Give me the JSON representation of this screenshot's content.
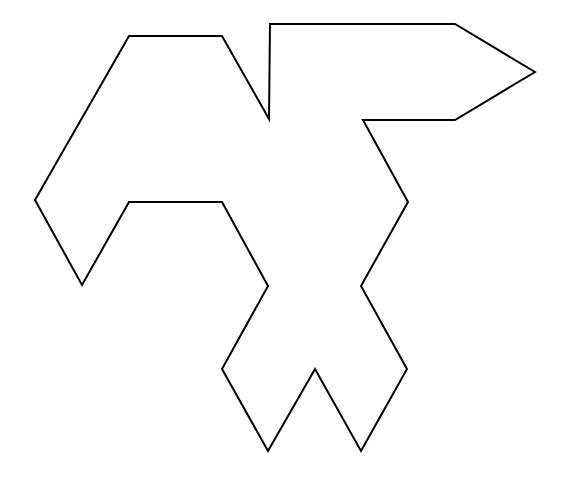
{
  "diagram": {
    "type": "polygon-outline",
    "stroke_color": "#000000",
    "fill_color": "#ffffff",
    "background_color": "#ffffff",
    "vertex_count": 20
  }
}
